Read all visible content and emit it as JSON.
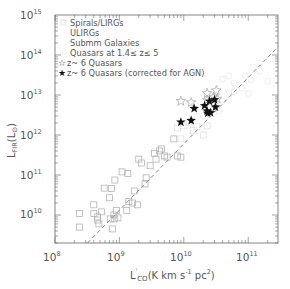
{
  "chart_data": {
    "type": "scatter",
    "title": "",
    "xlabel": "L'_CO (K km s^-1 pc^2)",
    "ylabel": "L_FIR (L_sun)",
    "xscale": "log",
    "yscale": "log",
    "xlim": [
      100000000.0,
      290000000000.0
    ],
    "ylim": [
      2000000000.0,
      1000000000000000.0
    ],
    "x_ticks": [
      "10^8",
      "10^9",
      "10^10",
      "10^11"
    ],
    "y_ticks": [
      "10^10",
      "10^11",
      "10^12",
      "10^13",
      "10^14",
      "10^15"
    ],
    "grid": false,
    "legend_position": "upper left",
    "legend": [
      "Spirals/LIRGs",
      "ULIRGs",
      "Submm Galaxies",
      "Quasars at 1.4≤ z≤ 5",
      "z~ 6 Quasars",
      "z~ 6 Quasars (corrected for AGN)"
    ],
    "fit_line": {
      "style": "dashed",
      "x": [
        320000000.0,
        290000000000.0
      ],
      "y": [
        2000000000.0,
        160000000000000.0
      ]
    },
    "series": [
      {
        "name": "Spirals/LIRGs",
        "marker": "open-square",
        "points": [
          [
            240000000.0,
            11000000000.0
          ],
          [
            240000000.0,
            5000000000.0
          ],
          [
            400000000.0,
            18000000000.0
          ],
          [
            400000000.0,
            11000000000.0
          ],
          [
            480000000.0,
            6000000000.0
          ],
          [
            460000000.0,
            9000000000.0
          ],
          [
            460000000.0,
            7500000000.0
          ],
          [
            530000000.0,
            12000000000.0
          ],
          [
            580000000.0,
            47000000000.0
          ],
          [
            700000000.0,
            27000000000.0
          ],
          [
            750000000.0,
            46000000000.0
          ],
          [
            720000000.0,
            8000000000.0
          ],
          [
            780000000.0,
            4500000000.0
          ],
          [
            820000000.0,
            10000000000.0
          ],
          [
            830000000.0,
            8000000000.0
          ],
          [
            900000000.0,
            13000000000.0
          ],
          [
            950000000.0,
            8500000000.0
          ],
          [
            850000000.0,
            75000000000.0
          ],
          [
            1100000000.0,
            120000000000.0
          ],
          [
            1350000000.0,
            110000000000.0
          ],
          [
            1300000000.0,
            13000000000.0
          ],
          [
            1600000000.0,
            20000000000.0
          ],
          [
            1700000000.0,
            40000000000.0
          ],
          [
            2000000000.0,
            250000000000.0
          ],
          [
            2200000000.0,
            200000000000.0
          ],
          [
            2500000000.0,
            60000000000.0
          ],
          [
            2600000000.0,
            85000000000.0
          ],
          [
            3000000000.0,
            170000000000.0
          ],
          [
            3500000000.0,
            350000000000.0
          ],
          [
            3700000000.0,
            250000000000.0
          ],
          [
            4200000000.0,
            400000000000.0
          ],
          [
            4500000000.0,
            450000000000.0
          ],
          [
            5000000000.0,
            300000000000.0
          ],
          [
            5500000000.0,
            280000000000.0
          ],
          [
            7000000000.0,
            800000000000.0
          ],
          [
            8000000000.0,
            300000000000.0
          ],
          [
            9000000000.0,
            280000000000.0
          ],
          [
            1400000000.0,
            22000000000.0
          ],
          [
            1900000000.0,
            18000000000.0
          ]
        ]
      },
      {
        "name": "ULIRGs",
        "marker": "open-square-light",
        "points": [
          [
            8000000000.0,
            1500000000000.0
          ],
          [
            10000000000.0,
            1700000000000.0
          ],
          [
            12000000000.0,
            2000000000000.0
          ],
          [
            16000000000.0,
            1600000000000.0
          ],
          [
            20000000000.0,
            1000000000000.0
          ],
          [
            23000000000.0,
            1700000000000.0
          ],
          [
            9000000000.0,
            800000000000.0
          ],
          [
            14000000000.0,
            1300000000000.0
          ]
        ]
      },
      {
        "name": "Submm Galaxies",
        "marker": "open-circle-light",
        "points": [
          [
            15000000000.0,
            6000000000000.0
          ],
          [
            25000000000.0,
            5000000000000.0
          ],
          [
            30000000000.0,
            9000000000000.0
          ],
          [
            40000000000.0,
            7000000000000.0
          ],
          [
            50000000000.0,
            11000000000000.0
          ],
          [
            20000000000.0,
            3000000000000.0
          ],
          [
            60000000000.0,
            12000000000000.0
          ],
          [
            35000000000.0,
            4000000000000.0
          ]
        ]
      },
      {
        "name": "Quasars at 1.4≤ z≤ 5",
        "marker": "open-diamond-light",
        "points": [
          [
            40000000000.0,
            25000000000000.0
          ],
          [
            60000000000.0,
            20000000000000.0
          ],
          [
            90000000000.0,
            30000000000000.0
          ],
          [
            150000000000.0,
            40000000000000.0
          ],
          [
            80000000000.0,
            15000000000000.0
          ],
          [
            200000000000.0,
            22000000000000.0
          ],
          [
            120000000000.0,
            50000000000000.0
          ],
          [
            50000000000.0,
            30000000000000.0
          ],
          [
            110000000000.0,
            24000000000000.0
          ],
          [
            100000000000.0,
            11000000000000.0
          ]
        ]
      },
      {
        "name": "z~ 6 Quasars",
        "marker": "open-star",
        "points": [
          [
            9000000000.0,
            7000000000000.0
          ],
          [
            13000000000.0,
            6500000000000.0
          ],
          [
            23000000000.0,
            7500000000000.0
          ],
          [
            32000000000.0,
            13000000000000.0
          ],
          [
            33000000000.0,
            8000000000000.0
          ],
          [
            23000000000.0,
            11000000000000.0
          ],
          [
            29000000000.0,
            9000000000000.0
          ]
        ]
      },
      {
        "name": "z~ 6 Quasars (corrected for AGN)",
        "marker": "filled-star",
        "points": [
          [
            9000000000.0,
            2100000000000.0
          ],
          [
            13000000000.0,
            2300000000000.0
          ],
          [
            14500000000.0,
            4600000000000.0
          ],
          [
            21000000000.0,
            5400000000000.0
          ],
          [
            23000000000.0,
            4000000000000.0
          ],
          [
            23500000000.0,
            3500000000000.0
          ],
          [
            25000000000.0,
            7000000000000.0
          ],
          [
            30000000000.0,
            7600000000000.0
          ],
          [
            31000000000.0,
            5000000000000.0
          ],
          [
            26000000000.0,
            3600000000000.0
          ]
        ]
      }
    ]
  },
  "axes": {
    "x_tick_labels": [
      {
        "base": "10",
        "exp": "8"
      },
      {
        "base": "10",
        "exp": "9"
      },
      {
        "base": "10",
        "exp": "10"
      },
      {
        "base": "10",
        "exp": "11"
      }
    ],
    "y_tick_labels": [
      {
        "base": "10",
        "exp": "15"
      },
      {
        "base": "10",
        "exp": "14"
      },
      {
        "base": "10",
        "exp": "13"
      },
      {
        "base": "10",
        "exp": "12"
      },
      {
        "base": "10",
        "exp": "11"
      },
      {
        "base": "10",
        "exp": "10"
      }
    ],
    "xlabel": {
      "main": "L",
      "prime": "'",
      "sub": "CO",
      "rest": "(K km s",
      "exp": "-1",
      "tail": " pc",
      "exp2": "2",
      "close": ")"
    },
    "ylabel": {
      "main": "L",
      "sub": "FIR",
      "rest": "(L",
      "sub2": "⊙",
      "close": ")"
    }
  },
  "legend": {
    "items": [
      {
        "label": "Spirals/LIRGs",
        "symbol": "square"
      },
      {
        "label": "ULIRGs",
        "symbol": "none"
      },
      {
        "label": "Submm Galaxies",
        "symbol": "none"
      },
      {
        "label": "Quasars at 1.4≤ z≤ 5",
        "symbol": "circle"
      },
      {
        "label": "z~ 6 Quasars",
        "symbol": "open-star"
      },
      {
        "label": "z~ 6 Quasars (corrected for AGN)",
        "symbol": "filled-star"
      }
    ]
  },
  "colors": {
    "axis": "#666666",
    "text": "#555555",
    "spirals": "#aaaaaa",
    "light": "#dddddd",
    "star": "#111111",
    "fit": "#888888"
  }
}
